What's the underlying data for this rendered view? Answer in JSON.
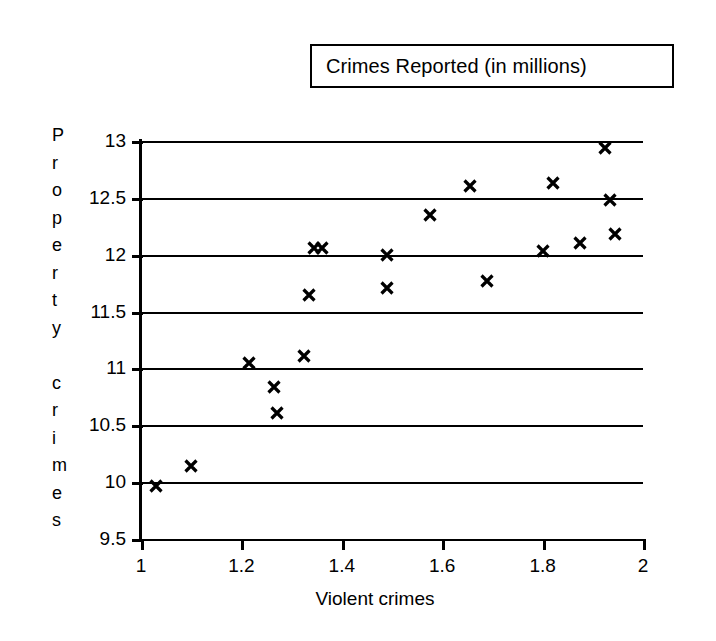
{
  "title": {
    "text": "Crimes Reported (in millions)"
  },
  "axes": {
    "x_title": "Violent crimes",
    "y_title": "Property crimes",
    "y_title_chars": [
      "P",
      "r",
      "o",
      "p",
      "e",
      "r",
      "t",
      "y",
      "",
      "c",
      "r",
      "i",
      "m",
      "e",
      "s"
    ],
    "x_ticks": [
      "1",
      "1.2",
      "1.4",
      "1.6",
      "1.8",
      "2"
    ],
    "y_ticks": [
      "13",
      "12.5",
      "12",
      "11.5",
      "11",
      "10.5",
      "10",
      "9.5"
    ]
  },
  "colors": {
    "ink": "#000000",
    "background": "#ffffff"
  },
  "chart_data": {
    "type": "scatter",
    "title": "Crimes Reported (in millions)",
    "xlabel": "Violent crimes",
    "ylabel": "Property crimes",
    "xlim": [
      1,
      2
    ],
    "ylim": [
      9.5,
      13
    ],
    "xticks": [
      1,
      1.2,
      1.4,
      1.6,
      1.8,
      2
    ],
    "yticks": [
      9.5,
      10,
      10.5,
      11,
      11.5,
      12,
      12.5,
      13
    ],
    "grid": "horizontal",
    "legend": "none",
    "marker": "x",
    "series": [
      {
        "name": "Crimes reported",
        "points": [
          [
            1.03,
            9.97
          ],
          [
            1.1,
            10.14
          ],
          [
            1.215,
            11.05
          ],
          [
            1.265,
            10.84
          ],
          [
            1.27,
            10.61
          ],
          [
            1.325,
            11.11
          ],
          [
            1.335,
            11.65
          ],
          [
            1.345,
            12.06
          ],
          [
            1.36,
            12.06
          ],
          [
            1.49,
            12.0
          ],
          [
            1.49,
            11.71
          ],
          [
            1.575,
            12.35
          ],
          [
            1.655,
            12.6
          ],
          [
            1.69,
            11.77
          ],
          [
            1.8,
            12.03
          ],
          [
            1.82,
            12.63
          ],
          [
            1.875,
            12.1
          ],
          [
            1.925,
            12.94
          ],
          [
            1.935,
            12.48
          ],
          [
            1.945,
            12.18
          ]
        ]
      }
    ]
  }
}
